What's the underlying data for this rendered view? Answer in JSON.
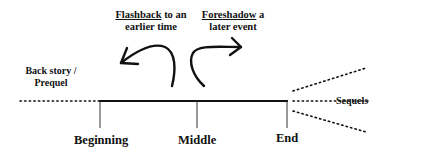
{
  "diagram": {
    "type": "narrative-timeline",
    "annotations": {
      "flashback": {
        "keyword": "Flashback",
        "rest_line1": " to an",
        "line2": "earlier time"
      },
      "foreshadow": {
        "keyword": "Foreshadow",
        "rest_line1": " a",
        "line2": "later event"
      }
    },
    "prequel": {
      "line1": "Back story /",
      "line2": "Prequel"
    },
    "sequels": {
      "label": "Sequels"
    },
    "timeline": {
      "points": [
        {
          "label": "Beginning"
        },
        {
          "label": "Middle"
        },
        {
          "label": "End"
        }
      ]
    },
    "colors": {
      "ink": "#111111",
      "background": "#ffffff"
    }
  }
}
